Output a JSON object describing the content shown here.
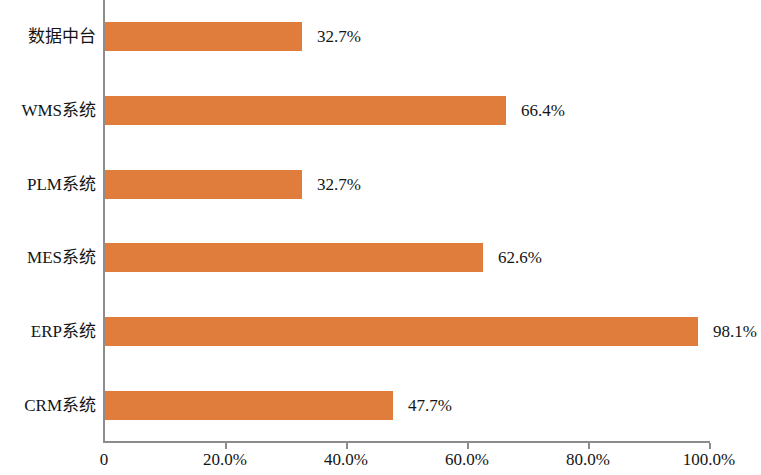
{
  "chart_data": {
    "type": "bar",
    "orientation": "horizontal",
    "title": "",
    "subtitle": "",
    "xlabel": "",
    "ylabel": "",
    "categories": [
      "CRM系统",
      "ERP系统",
      "MES系统",
      "PLM系统",
      "WMS系统",
      "数据中台"
    ],
    "values": [
      47.7,
      98.1,
      62.6,
      32.7,
      66.4,
      32.7
    ],
    "value_labels": [
      "47.7%",
      "98.1%",
      "62.6%",
      "32.7%",
      "66.4%",
      "32.7%"
    ],
    "display_order_top_to_bottom": [
      "数据中台",
      "WMS系统",
      "PLM系统",
      "MES系统",
      "ERP系统",
      "CRM系统"
    ],
    "xlim": [
      0,
      100
    ],
    "xticks": [
      0,
      20,
      40,
      60,
      80,
      100
    ],
    "xtick_labels": [
      "0",
      "20.0%",
      "40.0%",
      "60.0%",
      "80.0%",
      "100.0%"
    ],
    "grid": false,
    "legend": false,
    "legend_position": "none",
    "series": [
      {
        "name": "",
        "color": "#e07d3c",
        "values": [
          32.7,
          66.4,
          32.7,
          62.6,
          98.1,
          47.7
        ]
      }
    ],
    "bars": [
      {
        "category": "数据中台",
        "value": 32.7,
        "label": "32.7%",
        "color": "#e07d3c"
      },
      {
        "category": "WMS系统",
        "value": 66.4,
        "label": "66.4%",
        "color": "#e07d3c"
      },
      {
        "category": "PLM系统",
        "value": 32.7,
        "label": "32.7%",
        "color": "#e07d3c"
      },
      {
        "category": "MES系统",
        "value": 62.6,
        "label": "62.6%",
        "color": "#e07d3c"
      },
      {
        "category": "ERP系统",
        "value": 98.1,
        "label": "98.1%",
        "color": "#e07d3c"
      },
      {
        "category": "CRM系统",
        "value": 47.7,
        "label": "47.7%",
        "color": "#e07d3c"
      }
    ],
    "colors": {
      "bar": "#e07d3c",
      "axis": "#8c8c8c",
      "text": "#141414",
      "background": "#ffffff"
    }
  }
}
